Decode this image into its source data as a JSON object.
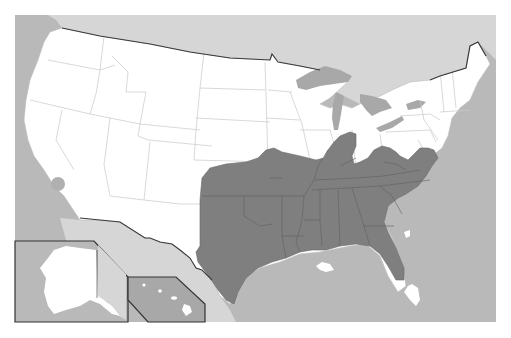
{
  "map": {
    "type": "choropleth-region",
    "subject": "United States",
    "colors": {
      "page_background": "#ffffff",
      "ocean": "#b9b9b9",
      "foreign_land": "#d6d6d6",
      "us_land": "#ffffff",
      "highlighted_region": "#7f7f7f",
      "lakes": "#a8a8a8",
      "state_borders": "#c8c8c8",
      "highlight_borders": "#5f5f5f",
      "national_border": "#3a3a3a",
      "inset_frame": "#333333",
      "marker": "#b0b0b0"
    },
    "highlighted_region": {
      "label": "",
      "description": "Shaded area covering the south-central and southeastern United States",
      "states_fully_shaded": [
        "Texas",
        "Oklahoma",
        "Arkansas",
        "Louisiana",
        "Mississippi",
        "Alabama",
        "Georgia",
        "Tennessee",
        "South Carolina",
        "North Carolina",
        "Kentucky"
      ],
      "states_partially_shaded": [
        "Kansas",
        "Missouri",
        "Illinois",
        "Indiana",
        "Ohio",
        "West Virginia",
        "Virginia",
        "Florida"
      ]
    },
    "markers": [
      {
        "name": "circle-marker",
        "location": "Southern California"
      }
    ],
    "insets": [
      {
        "name": "Alaska"
      },
      {
        "name": "Hawaii"
      }
    ]
  }
}
